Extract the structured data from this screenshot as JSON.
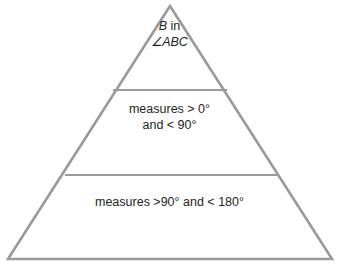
{
  "diagram": {
    "type": "triangle-tier-diagram",
    "colors": {
      "stroke": "#9a9a9a",
      "text": "#231f20",
      "background": "#ffffff"
    },
    "geometry": {
      "apex": [
        170,
        6
      ],
      "base_left": [
        8,
        259
      ],
      "base_right": [
        332,
        259
      ],
      "divider_1": {
        "y": 90,
        "x_left": 113,
        "x_right": 227
      },
      "divider_2": {
        "y": 175,
        "x_left": 65,
        "x_right": 278
      },
      "stroke_width": 2.6
    },
    "tiers": [
      {
        "name": "vertex-tier",
        "lines": [
          {
            "parts": [
              {
                "text": "B",
                "italic": true
              },
              {
                "text": " in",
                "italic": false
              }
            ]
          },
          {
            "parts": [
              {
                "text": "∠ABC",
                "italic": true
              }
            ]
          }
        ],
        "plain_text": "B in ∠ABC"
      },
      {
        "name": "acute-tier",
        "lines": [
          {
            "parts": [
              {
                "text": "measures > 0°",
                "italic": false
              }
            ]
          },
          {
            "parts": [
              {
                "text": "and < 90°",
                "italic": false
              }
            ]
          }
        ],
        "plain_text": "measures > 0° and < 90°"
      },
      {
        "name": "obtuse-tier",
        "lines": [
          {
            "parts": [
              {
                "text": "measures >90° and < 180°",
                "italic": false
              }
            ]
          }
        ],
        "plain_text": "measures >90° and < 180°"
      }
    ],
    "text": {
      "top_line_1_italic": "B",
      "top_line_1_rest": " in",
      "top_line_2": "∠ABC",
      "middle_line_1": "measures > 0°",
      "middle_line_2": "and < 90°",
      "bottom_line_1": "measures >90° and < 180°"
    }
  }
}
